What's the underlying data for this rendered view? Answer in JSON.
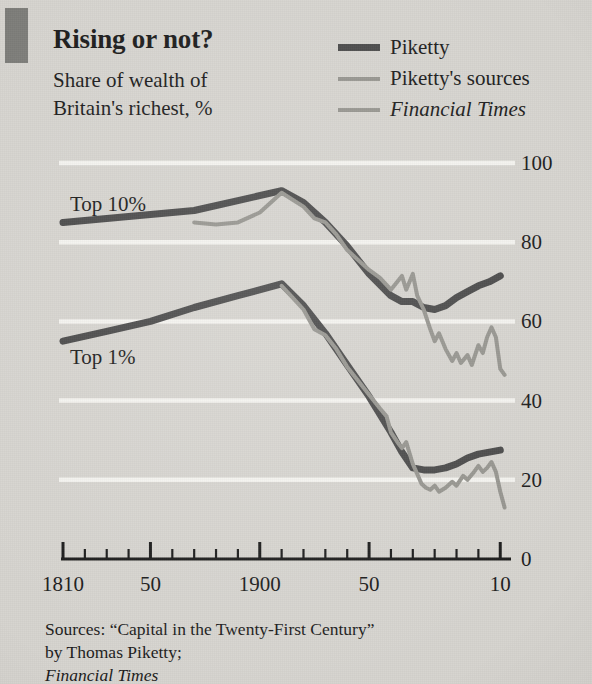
{
  "header": {
    "title": "Rising or not?",
    "subtitle_line1": "Share of wealth of",
    "subtitle_line2": "Britain's richest, %"
  },
  "legend": {
    "position": "top-right",
    "items": [
      {
        "label": "Piketty",
        "color": "#4a4a4a",
        "width": 7,
        "italic": false,
        "name": "piketty"
      },
      {
        "label": "Piketty's sources",
        "color": "#96958f",
        "width": 4,
        "italic": false,
        "name": "piketty-sources"
      },
      {
        "label": "Financial Times",
        "color": "#96958f",
        "width": 4,
        "italic": true,
        "name": "financial-times"
      }
    ]
  },
  "series_labels": {
    "top10": "Top 10%",
    "top1": "Top 1%"
  },
  "source": {
    "line1_plain": "Sources: “Capital in the Twenty-First Century”",
    "line2_plain": "by Thomas Piketty; ",
    "line2_italic": "Financial Times"
  },
  "colors": {
    "background": "#d6d4cf",
    "accent_bar": "#7d7d79",
    "piketty": "#4a4a4a",
    "sources": "#96958f",
    "gridline": "#f6f5f1",
    "axis": "#1b1b1b",
    "text": "#1b1b1b"
  },
  "chart_data": {
    "type": "line",
    "title": "Rising or not?",
    "subtitle": "Share of wealth of Britain's richest, %",
    "xlabel": "",
    "ylabel": "",
    "xlim": [
      1810,
      2014
    ],
    "ylim": [
      0,
      100
    ],
    "y_ticks": [
      0,
      20,
      40,
      60,
      80,
      100
    ],
    "y_tick_labels": [
      "0",
      "20",
      "40",
      "60",
      "80",
      "100"
    ],
    "y_axis_position": "right",
    "x_ticks_major": [
      1810,
      1850,
      1900,
      1950,
      2010
    ],
    "x_tick_labels": [
      "1810",
      "50",
      "1900",
      "50",
      "10"
    ],
    "x_ticks_minor_step": 10,
    "grid": "horizontal-white",
    "legend_position": "top-right",
    "annotations": [
      {
        "text": "Top 10%",
        "x": 1820,
        "y": 90
      },
      {
        "text": "Top 1%",
        "x": 1820,
        "y": 52
      }
    ],
    "series": [
      {
        "name": "Piketty",
        "group": "Top 10%",
        "color": "#4a4a4a",
        "width": 7,
        "points": [
          [
            1810,
            85.0
          ],
          [
            1830,
            86.0
          ],
          [
            1850,
            87.0
          ],
          [
            1870,
            88.0
          ],
          [
            1890,
            90.5
          ],
          [
            1910,
            93.0
          ],
          [
            1920,
            90.0
          ],
          [
            1930,
            85.0
          ],
          [
            1940,
            79.0
          ],
          [
            1950,
            72.0
          ],
          [
            1960,
            66.5
          ],
          [
            1965,
            65.0
          ],
          [
            1970,
            65.0
          ],
          [
            1975,
            63.5
          ],
          [
            1980,
            63.0
          ],
          [
            1985,
            64.0
          ],
          [
            1990,
            66.0
          ],
          [
            1995,
            67.5
          ],
          [
            2000,
            69.0
          ],
          [
            2005,
            70.0
          ],
          [
            2010,
            71.5
          ]
        ]
      },
      {
        "name": "Piketty's sources",
        "group": "Top 10%",
        "color": "#96958f",
        "width": 4,
        "points": [
          [
            1870,
            85.0
          ],
          [
            1880,
            84.5
          ],
          [
            1890,
            85.0
          ],
          [
            1900,
            87.5
          ],
          [
            1910,
            92.5
          ],
          [
            1920,
            89.0
          ],
          [
            1925,
            86.0
          ],
          [
            1930,
            85.0
          ],
          [
            1935,
            82.0
          ],
          [
            1940,
            78.0
          ],
          [
            1950,
            73.0
          ],
          [
            1955,
            71.0
          ],
          [
            1960,
            68.0
          ],
          [
            1965,
            71.5
          ],
          [
            1967,
            68.0
          ],
          [
            1970,
            72.0
          ],
          [
            1972,
            66.5
          ],
          [
            1975,
            63.0
          ],
          [
            1978,
            58.0
          ],
          [
            1980,
            55.0
          ],
          [
            1982,
            57.0
          ],
          [
            1985,
            53.0
          ],
          [
            1988,
            50.0
          ],
          [
            1990,
            52.0
          ],
          [
            1992,
            49.5
          ],
          [
            1995,
            51.5
          ],
          [
            1997,
            49.0
          ],
          [
            2000,
            54.0
          ],
          [
            2002,
            52.0
          ],
          [
            2004,
            56.0
          ],
          [
            2006,
            58.5
          ],
          [
            2008,
            56.0
          ],
          [
            2010,
            48.0
          ],
          [
            2012,
            46.5
          ]
        ]
      },
      {
        "name": "Piketty",
        "group": "Top 1%",
        "color": "#4a4a4a",
        "width": 7,
        "points": [
          [
            1810,
            55.0
          ],
          [
            1830,
            57.5
          ],
          [
            1850,
            60.0
          ],
          [
            1870,
            63.5
          ],
          [
            1890,
            66.5
          ],
          [
            1910,
            69.5
          ],
          [
            1920,
            64.0
          ],
          [
            1930,
            57.0
          ],
          [
            1940,
            49.0
          ],
          [
            1950,
            41.0
          ],
          [
            1960,
            32.0
          ],
          [
            1965,
            27.0
          ],
          [
            1970,
            23.0
          ],
          [
            1975,
            22.5
          ],
          [
            1980,
            22.5
          ],
          [
            1985,
            23.0
          ],
          [
            1990,
            24.0
          ],
          [
            1995,
            25.5
          ],
          [
            2000,
            26.5
          ],
          [
            2005,
            27.0
          ],
          [
            2010,
            27.5
          ]
        ]
      },
      {
        "name": "Piketty's sources",
        "group": "Top 1%",
        "color": "#96958f",
        "width": 4,
        "points": [
          [
            1910,
            69.0
          ],
          [
            1915,
            66.0
          ],
          [
            1920,
            63.0
          ],
          [
            1925,
            58.0
          ],
          [
            1930,
            56.5
          ],
          [
            1935,
            53.0
          ],
          [
            1940,
            48.5
          ],
          [
            1945,
            45.0
          ],
          [
            1950,
            41.5
          ],
          [
            1955,
            38.0
          ],
          [
            1958,
            36.0
          ],
          [
            1960,
            32.0
          ],
          [
            1963,
            29.5
          ],
          [
            1965,
            28.0
          ],
          [
            1967,
            29.5
          ],
          [
            1970,
            24.0
          ],
          [
            1972,
            21.5
          ],
          [
            1974,
            19.0
          ],
          [
            1976,
            18.0
          ],
          [
            1978,
            17.5
          ],
          [
            1980,
            18.5
          ],
          [
            1982,
            17.0
          ],
          [
            1985,
            18.0
          ],
          [
            1988,
            19.5
          ],
          [
            1990,
            18.5
          ],
          [
            1993,
            21.0
          ],
          [
            1995,
            20.0
          ],
          [
            1998,
            22.0
          ],
          [
            2000,
            23.5
          ],
          [
            2002,
            22.0
          ],
          [
            2004,
            23.0
          ],
          [
            2006,
            24.5
          ],
          [
            2008,
            22.0
          ],
          [
            2010,
            17.0
          ],
          [
            2012,
            13.0
          ]
        ]
      }
    ]
  }
}
